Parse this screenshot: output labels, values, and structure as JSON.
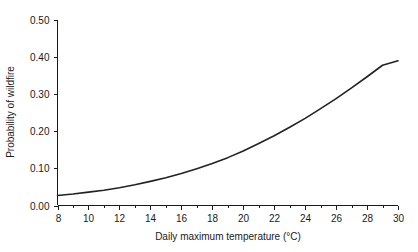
{
  "chart_data": {
    "type": "line",
    "title": "",
    "xlabel": "Daily maximum temperature (°C)",
    "ylabel": "Probability of wildfire",
    "xlim": [
      8,
      30
    ],
    "ylim": [
      0.0,
      0.5
    ],
    "grid": false,
    "legend": null,
    "x_ticks": [
      8,
      10,
      12,
      14,
      16,
      18,
      20,
      22,
      24,
      26,
      28,
      30
    ],
    "x_tick_labels": [
      "8",
      "10",
      "12",
      "14",
      "16",
      "18",
      "20",
      "22",
      "24",
      "26",
      "28",
      "30"
    ],
    "x_minor_ticks": [
      9,
      11,
      13,
      15,
      17,
      19,
      21,
      23,
      25,
      27,
      29
    ],
    "y_ticks": [
      0.0,
      0.1,
      0.2,
      0.3,
      0.4,
      0.5
    ],
    "y_tick_labels": [
      "0.00",
      "0.10",
      "0.20",
      "0.30",
      "0.40",
      "0.50"
    ],
    "line_color": "#222222",
    "series": [
      {
        "name": "Probability of wildfire",
        "x": [
          8,
          9,
          10,
          11,
          12,
          13,
          14,
          15,
          16,
          17,
          18,
          19,
          20,
          21,
          22,
          23,
          24,
          25,
          26,
          27,
          28,
          29,
          30
        ],
        "values": [
          0.027,
          0.031,
          0.036,
          0.041,
          0.048,
          0.056,
          0.065,
          0.075,
          0.086,
          0.099,
          0.113,
          0.129,
          0.147,
          0.167,
          0.188,
          0.211,
          0.235,
          0.261,
          0.288,
          0.317,
          0.347,
          0.378,
          0.39
        ]
      }
    ]
  }
}
